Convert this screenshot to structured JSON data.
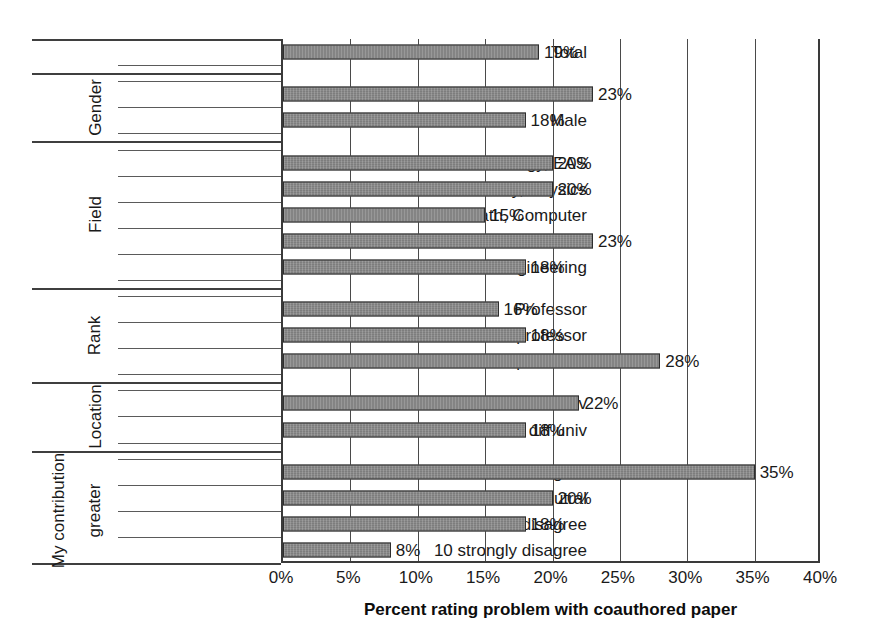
{
  "chart_data": {
    "type": "bar",
    "orientation": "horizontal",
    "title": "",
    "xlabel": "Percent rating problem with coauthored paper",
    "ylabel": "",
    "xlim": [
      0,
      40
    ],
    "xticks": [
      "0%",
      "5%",
      "10%",
      "15%",
      "20%",
      "25%",
      "30%",
      "35%",
      "40%"
    ],
    "xtick_values": [
      0,
      5,
      10,
      15,
      20,
      25,
      30,
      35,
      40
    ],
    "grid": "vertical",
    "legend": "none",
    "value_suffix": "%",
    "groups": [
      {
        "name": "",
        "name2": "",
        "categories": [
          "Total"
        ],
        "values": [
          19
        ],
        "labels": [
          "19%"
        ]
      },
      {
        "name": "Gender",
        "name2": "",
        "categories": [
          "Female",
          "Male"
        ],
        "values": [
          23,
          18
        ],
        "labels": [
          "23%",
          "18%"
        ]
      },
      {
        "name": "Field",
        "name2": "",
        "categories": [
          "Biology, EAS",
          "Chemistry, Physics",
          "Math, Computer",
          "Economics",
          "Engineering"
        ],
        "values": [
          20,
          20,
          15,
          23,
          18
        ],
        "labels": [
          "20%",
          "20%",
          "15%",
          "23%",
          "18%"
        ]
      },
      {
        "name": "Rank",
        "name2": "",
        "categories": [
          "Professor",
          "Associate professor",
          "Assistant professor"
        ],
        "values": [
          16,
          18,
          28
        ],
        "labels": [
          "16%",
          "18%",
          "28%"
        ]
      },
      {
        "name": "Location",
        "name2": "",
        "categories": [
          "All same univ",
          "At least 1 diff univ"
        ],
        "values": [
          22,
          18
        ],
        "labels": [
          "22%",
          "18%"
        ]
      },
      {
        "name": "My contribution",
        "name2": "greater",
        "categories": [
          "1-3 agree",
          "4-6 neutral",
          "7-9 disagree",
          "10 strongly disagree"
        ],
        "values": [
          35,
          20,
          18,
          8
        ],
        "labels": [
          "35%",
          "20%",
          "18%",
          "8%"
        ]
      }
    ],
    "categories": [
      "Total",
      "Female",
      "Male",
      "Biology, EAS",
      "Chemistry, Physics",
      "Math, Computer",
      "Economics",
      "Engineering",
      "Professor",
      "Associate professor",
      "Assistant professor",
      "All same univ",
      "At least 1 diff univ",
      "1-3 agree",
      "4-6 neutral",
      "7-9 disagree",
      "10 strongly disagree"
    ],
    "values": [
      19,
      23,
      18,
      20,
      20,
      15,
      23,
      18,
      16,
      18,
      28,
      22,
      18,
      35,
      20,
      18,
      8
    ],
    "colors": {
      "bar_fill": "#7d7d7d",
      "bar_stroke": "#2e2e2e",
      "axis": "#3a3a3a",
      "grid": "#4a4a4a",
      "text": "#1a1a1a"
    }
  }
}
